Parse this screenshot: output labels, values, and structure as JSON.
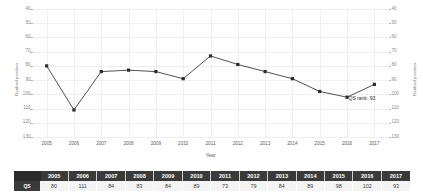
{
  "chart_data": {
    "type": "line",
    "title": "",
    "xlabel": "Year",
    "ylabel": "Ranked position",
    "ylabel_right": "Ranked position",
    "categories": [
      2005,
      2006,
      2007,
      2008,
      2009,
      2010,
      2011,
      2012,
      2013,
      2014,
      2015,
      2016,
      2017
    ],
    "x_tick_labels": [
      "2005",
      "2006",
      "2007",
      "2008",
      "2009",
      "2010",
      "2011",
      "2012",
      "2013",
      "2014",
      "2015",
      "2016",
      "2017"
    ],
    "values": [
      80,
      111,
      84,
      83,
      84,
      89,
      73,
      79,
      84,
      89,
      98,
      102,
      93
    ],
    "series": [
      {
        "name": "QS",
        "values": [
          80,
          111,
          84,
          83,
          84,
          89,
          73,
          79,
          84,
          89,
          98,
          102,
          93
        ]
      }
    ],
    "y_tick_labels": [
      "40",
      "50",
      "60",
      "70",
      "80",
      "90",
      "100",
      "110",
      "120",
      "130"
    ],
    "y_ticks": [
      40,
      50,
      60,
      70,
      80,
      90,
      100,
      110,
      120,
      130
    ],
    "ylim": [
      40,
      130
    ],
    "y_inverted": true,
    "grid": true,
    "legend": false,
    "annotations": [
      {
        "text": "QS rank: 93",
        "x": 2016,
        "y": 102
      }
    ],
    "line_color": "#3d3d3d",
    "marker_color": "#2b2b2b",
    "grid_color": "#f0f0f0"
  },
  "table": {
    "corner_label": "",
    "headers": [
      "2005",
      "2006",
      "2007",
      "2008",
      "2009",
      "2010",
      "2011",
      "2012",
      "2013",
      "2014",
      "2015",
      "2016",
      "2017"
    ],
    "rows": [
      {
        "label": "QS",
        "values": [
          "80",
          "111",
          "84",
          "83",
          "84",
          "89",
          "73",
          "79",
          "84",
          "89",
          "98",
          "102",
          "93"
        ]
      }
    ],
    "header_bg": "#3a3a3a",
    "header_fg": "#ffffff",
    "cell_bg": "#f4f4f4",
    "cell_fg": "#3a3a3a"
  }
}
